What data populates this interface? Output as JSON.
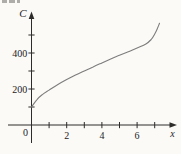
{
  "figure": {
    "description_title": "",
    "ylabel": "C",
    "xlabel": "x",
    "origin_label": "0"
  },
  "colors": {
    "axis": "#2e2c2a",
    "curve": "#7d7d7d",
    "text": "#24221f",
    "background": "#fbfaf7"
  },
  "chart_data": {
    "type": "line",
    "title": "",
    "xlabel": "x",
    "ylabel": "C",
    "xlim": [
      0,
      7.8
    ],
    "ylim": [
      0,
      620
    ],
    "grid": false,
    "x_ticks": [
      1,
      2,
      3,
      4,
      5,
      6,
      7
    ],
    "labeled_x_ticks": [
      2,
      4,
      6
    ],
    "y_ticks": [
      100,
      200,
      300,
      400,
      500
    ],
    "labeled_y_ticks": [
      200,
      400
    ],
    "origin_label": "0",
    "series": [
      {
        "name": "C",
        "points": [
          [
            0,
            100
          ],
          [
            0.3,
            140
          ],
          [
            0.6,
            168
          ],
          [
            1,
            194
          ],
          [
            1.5,
            225
          ],
          [
            2,
            252
          ],
          [
            2.5,
            277
          ],
          [
            3,
            300
          ],
          [
            3.5,
            323
          ],
          [
            4,
            345
          ],
          [
            4.5,
            367
          ],
          [
            5,
            388
          ],
          [
            5.5,
            407
          ],
          [
            6,
            428
          ],
          [
            6.5,
            450
          ],
          [
            6.8,
            475
          ],
          [
            7,
            505
          ],
          [
            7.15,
            535
          ],
          [
            7.27,
            565
          ]
        ]
      }
    ]
  }
}
